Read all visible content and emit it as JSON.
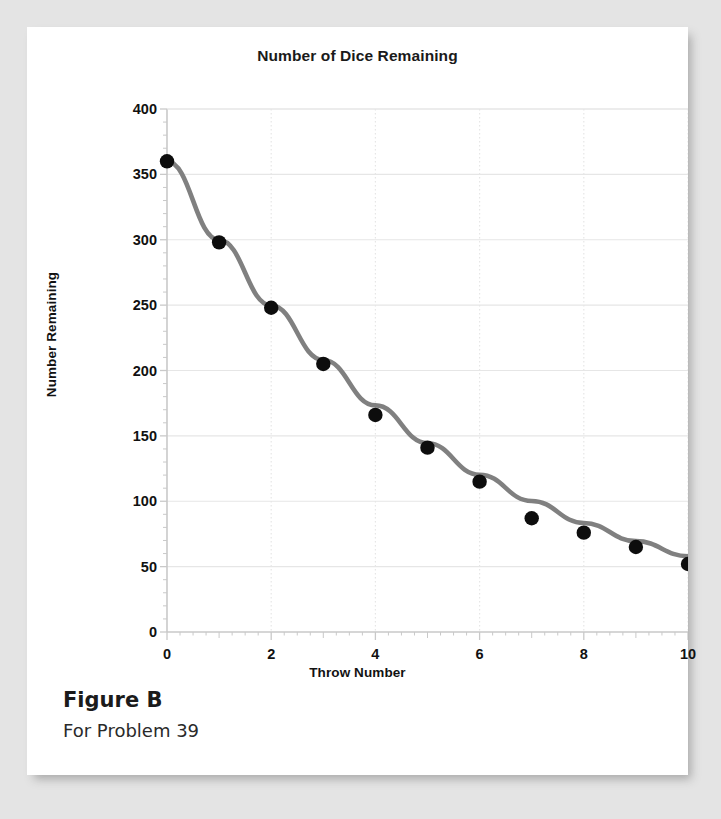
{
  "figure": {
    "caption_title": "Figure B",
    "caption_sub": "For Problem 39"
  },
  "colors": {
    "page_background": "#e4e4e4",
    "card_background": "#ffffff",
    "curve": "#808080",
    "point": "#0d0d0d",
    "grid": "#e6e6e6",
    "axis": "#c9c9c9",
    "text": "#111111"
  },
  "chart_data": {
    "type": "scatter",
    "title": "Number of Dice Remaining",
    "xlabel": "Throw Number",
    "ylabel": "Number Remaining",
    "xlim": [
      0,
      10
    ],
    "ylim": [
      0,
      400
    ],
    "xticks": [
      0,
      2,
      4,
      6,
      8,
      10
    ],
    "xtick_labels": [
      "0",
      "2",
      "4",
      "6",
      "8",
      "10"
    ],
    "xminor_ticks": [
      1,
      3,
      5,
      7,
      9
    ],
    "yticks": [
      0,
      50,
      100,
      150,
      200,
      250,
      300,
      350,
      400
    ],
    "ytick_labels": [
      "0",
      "50",
      "100",
      "150",
      "200",
      "250",
      "300",
      "350",
      "400"
    ],
    "yminor_step": 10,
    "grid": true,
    "legend": "none",
    "x": [
      0,
      1,
      2,
      3,
      4,
      5,
      6,
      7,
      8,
      9,
      10
    ],
    "values": [
      360,
      298,
      248,
      205,
      166,
      141,
      115,
      87,
      76,
      65,
      52
    ],
    "series": [
      {
        "name": "Dice remaining",
        "marker": "filled-circle",
        "values": [
          360,
          298,
          248,
          205,
          166,
          141,
          115,
          87,
          76,
          65,
          52
        ]
      },
      {
        "name": "Fitted exponential curve",
        "marker": "none",
        "line": "solid",
        "values": [
          360,
          299.8,
          249.7,
          208.0,
          173.3,
          144.4,
          120.3,
          100.2,
          83.4,
          69.5,
          57.9
        ]
      }
    ]
  }
}
